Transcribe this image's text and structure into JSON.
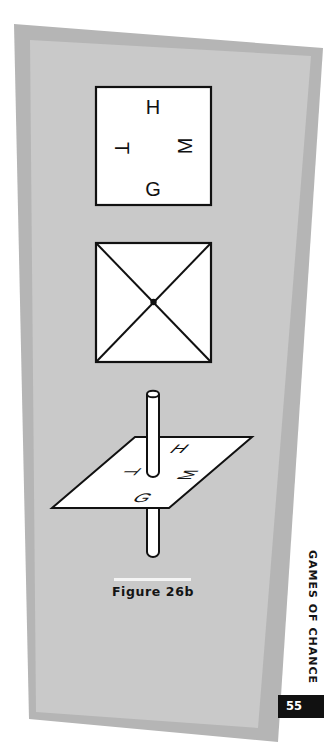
{
  "page": {
    "section_title": "GAMES OF CHANCE",
    "page_number": "55",
    "colors": {
      "outer_panel": "#b5b5b5",
      "inner_panel": "#c9c9c9",
      "figure_fill": "#ffffff",
      "stroke": "#111111",
      "page_box": "#111111"
    }
  },
  "figure": {
    "caption": "Figure 26b",
    "top_square": {
      "labels": {
        "top": "H",
        "bottom": "G",
        "left": "T",
        "right": "M"
      }
    },
    "middle_square": {
      "description": "square with diagonals and center dot"
    },
    "spinner": {
      "labels": {
        "top": "H",
        "bottom": "G",
        "left": "T",
        "right": "M"
      }
    }
  }
}
